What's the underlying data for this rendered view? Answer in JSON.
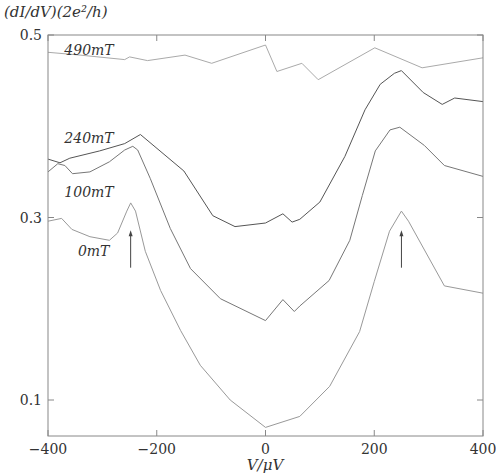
{
  "chart_data": {
    "type": "line",
    "title": "",
    "xlabel": "V/μV",
    "ylabel": "(dI/dV)(2e²/h)",
    "xlim": [
      -400,
      400
    ],
    "ylim": [
      0.063,
      0.5
    ],
    "grid": false,
    "x_ticks": [
      -400,
      -200,
      0,
      200,
      400
    ],
    "x_tick_labels": [
      "−400",
      "−200",
      "0",
      "200",
      "400"
    ],
    "y_ticks": [
      0.1,
      0.3,
      0.5
    ],
    "y_tick_labels": [
      "0.1",
      "0.3",
      "0.5"
    ],
    "series": [
      {
        "name": "490mT",
        "color": "#aaaaaa",
        "points": [
          [
            -400,
            0.481
          ],
          [
            -341,
            0.478
          ],
          [
            -259,
            0.473
          ],
          [
            -250,
            0.476
          ],
          [
            -217,
            0.472
          ],
          [
            -148,
            0.478
          ],
          [
            -99,
            0.469
          ],
          [
            0,
            0.489
          ],
          [
            21,
            0.46
          ],
          [
            67,
            0.469
          ],
          [
            97,
            0.451
          ],
          [
            201,
            0.486
          ],
          [
            288,
            0.464
          ],
          [
            400,
            0.475
          ]
        ]
      },
      {
        "name": "240mT",
        "color": "#555555",
        "points": [
          [
            -400,
            0.364
          ],
          [
            -378,
            0.36
          ],
          [
            -360,
            0.365
          ],
          [
            -305,
            0.373
          ],
          [
            -259,
            0.381
          ],
          [
            -230,
            0.391
          ],
          [
            -150,
            0.351
          ],
          [
            -97,
            0.302
          ],
          [
            -56,
            0.29
          ],
          [
            0,
            0.294
          ],
          [
            32,
            0.304
          ],
          [
            49,
            0.295
          ],
          [
            63,
            0.298
          ],
          [
            100,
            0.317
          ],
          [
            146,
            0.367
          ],
          [
            183,
            0.418
          ],
          [
            211,
            0.446
          ],
          [
            237,
            0.458
          ],
          [
            250,
            0.461
          ],
          [
            290,
            0.437
          ],
          [
            325,
            0.424
          ],
          [
            348,
            0.431
          ],
          [
            400,
            0.427
          ]
        ]
      },
      {
        "name": "100mT",
        "color": "#777777",
        "points": [
          [
            -400,
            0.35
          ],
          [
            -382,
            0.359
          ],
          [
            -369,
            0.357
          ],
          [
            -355,
            0.348
          ],
          [
            -323,
            0.35
          ],
          [
            -287,
            0.361
          ],
          [
            -259,
            0.374
          ],
          [
            -244,
            0.378
          ],
          [
            -235,
            0.374
          ],
          [
            -212,
            0.343
          ],
          [
            -175,
            0.288
          ],
          [
            -138,
            0.244
          ],
          [
            -83,
            0.211
          ],
          [
            0,
            0.187
          ],
          [
            32,
            0.21
          ],
          [
            53,
            0.197
          ],
          [
            63,
            0.203
          ],
          [
            117,
            0.231
          ],
          [
            155,
            0.275
          ],
          [
            178,
            0.324
          ],
          [
            202,
            0.373
          ],
          [
            229,
            0.396
          ],
          [
            247,
            0.399
          ],
          [
            292,
            0.379
          ],
          [
            329,
            0.357
          ],
          [
            400,
            0.345
          ]
        ]
      },
      {
        "name": "0mT",
        "color": "#999999",
        "points": [
          [
            -400,
            0.296
          ],
          [
            -375,
            0.299
          ],
          [
            -356,
            0.287
          ],
          [
            -323,
            0.279
          ],
          [
            -287,
            0.275
          ],
          [
            -272,
            0.283
          ],
          [
            -255,
            0.307
          ],
          [
            -248,
            0.316
          ],
          [
            -239,
            0.307
          ],
          [
            -221,
            0.263
          ],
          [
            -193,
            0.22
          ],
          [
            -156,
            0.176
          ],
          [
            -120,
            0.138
          ],
          [
            -65,
            0.1
          ],
          [
            0,
            0.07
          ],
          [
            63,
            0.082
          ],
          [
            118,
            0.115
          ],
          [
            173,
            0.175
          ],
          [
            200,
            0.23
          ],
          [
            228,
            0.285
          ],
          [
            250,
            0.307
          ],
          [
            263,
            0.296
          ],
          [
            329,
            0.225
          ],
          [
            400,
            0.217
          ]
        ]
      }
    ],
    "annotations": [
      {
        "text": "490mT",
        "x": -370,
        "y": 0.484
      },
      {
        "text": "240mT",
        "x": -370,
        "y": 0.387
      },
      {
        "text": "100mT",
        "x": -370,
        "y": 0.328
      },
      {
        "text": "0mT",
        "x": -345,
        "y": 0.263
      },
      {
        "type": "arrow",
        "x": -248,
        "y_from": 0.245,
        "y_to": 0.285
      },
      {
        "type": "arrow",
        "x": 250,
        "y_from": 0.245,
        "y_to": 0.285
      }
    ]
  }
}
